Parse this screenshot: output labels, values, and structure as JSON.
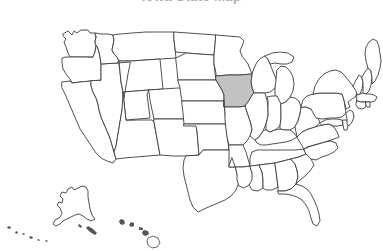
{
  "page": {
    "background_color": "#ffffff",
    "width": 383,
    "height": 251
  },
  "map": {
    "title": "Iowa State Map",
    "title_clipped": true,
    "type": "choropleth-outline",
    "region": "United States of America",
    "projection": "albers-usa",
    "outline_color": "#3c3c44",
    "default_fill": "#ffffff",
    "highlight_fill": "#c2c2c2",
    "highlighted_states": [
      "Iowa"
    ],
    "legend_visible": false,
    "labels_visible": false,
    "states": [
      {
        "code": "WA",
        "name": "Washington",
        "highlighted": false
      },
      {
        "code": "OR",
        "name": "Oregon",
        "highlighted": false
      },
      {
        "code": "CA",
        "name": "California",
        "highlighted": false
      },
      {
        "code": "NV",
        "name": "Nevada",
        "highlighted": false
      },
      {
        "code": "ID",
        "name": "Idaho",
        "highlighted": false
      },
      {
        "code": "MT",
        "name": "Montana",
        "highlighted": false
      },
      {
        "code": "WY",
        "name": "Wyoming",
        "highlighted": false
      },
      {
        "code": "UT",
        "name": "Utah",
        "highlighted": false
      },
      {
        "code": "AZ",
        "name": "Arizona",
        "highlighted": false
      },
      {
        "code": "CO",
        "name": "Colorado",
        "highlighted": false
      },
      {
        "code": "NM",
        "name": "New Mexico",
        "highlighted": false
      },
      {
        "code": "ND",
        "name": "North Dakota",
        "highlighted": false
      },
      {
        "code": "SD",
        "name": "South Dakota",
        "highlighted": false
      },
      {
        "code": "NE",
        "name": "Nebraska",
        "highlighted": false
      },
      {
        "code": "KS",
        "name": "Kansas",
        "highlighted": false
      },
      {
        "code": "OK",
        "name": "Oklahoma",
        "highlighted": false
      },
      {
        "code": "TX",
        "name": "Texas",
        "highlighted": false
      },
      {
        "code": "MN",
        "name": "Minnesota",
        "highlighted": false
      },
      {
        "code": "IA",
        "name": "Iowa",
        "highlighted": true
      },
      {
        "code": "MO",
        "name": "Missouri",
        "highlighted": false
      },
      {
        "code": "AR",
        "name": "Arkansas",
        "highlighted": false
      },
      {
        "code": "LA",
        "name": "Louisiana",
        "highlighted": false
      },
      {
        "code": "WI",
        "name": "Wisconsin",
        "highlighted": false
      },
      {
        "code": "IL",
        "name": "Illinois",
        "highlighted": false
      },
      {
        "code": "MI",
        "name": "Michigan",
        "highlighted": false
      },
      {
        "code": "IN",
        "name": "Indiana",
        "highlighted": false
      },
      {
        "code": "OH",
        "name": "Ohio",
        "highlighted": false
      },
      {
        "code": "KY",
        "name": "Kentucky",
        "highlighted": false
      },
      {
        "code": "TN",
        "name": "Tennessee",
        "highlighted": false
      },
      {
        "code": "MS",
        "name": "Mississippi",
        "highlighted": false
      },
      {
        "code": "AL",
        "name": "Alabama",
        "highlighted": false
      },
      {
        "code": "GA",
        "name": "Georgia",
        "highlighted": false
      },
      {
        "code": "FL",
        "name": "Florida",
        "highlighted": false
      },
      {
        "code": "SC",
        "name": "South Carolina",
        "highlighted": false
      },
      {
        "code": "NC",
        "name": "North Carolina",
        "highlighted": false
      },
      {
        "code": "VA",
        "name": "Virginia",
        "highlighted": false
      },
      {
        "code": "WV",
        "name": "West Virginia",
        "highlighted": false
      },
      {
        "code": "MD",
        "name": "Maryland",
        "highlighted": false
      },
      {
        "code": "DE",
        "name": "Delaware",
        "highlighted": false
      },
      {
        "code": "PA",
        "name": "Pennsylvania",
        "highlighted": false
      },
      {
        "code": "NJ",
        "name": "New Jersey",
        "highlighted": false
      },
      {
        "code": "NY",
        "name": "New York",
        "highlighted": false
      },
      {
        "code": "CT",
        "name": "Connecticut",
        "highlighted": false
      },
      {
        "code": "RI",
        "name": "Rhode Island",
        "highlighted": false
      },
      {
        "code": "MA",
        "name": "Massachusetts",
        "highlighted": false
      },
      {
        "code": "VT",
        "name": "Vermont",
        "highlighted": false
      },
      {
        "code": "NH",
        "name": "New Hampshire",
        "highlighted": false
      },
      {
        "code": "ME",
        "name": "Maine",
        "highlighted": false
      },
      {
        "code": "AK",
        "name": "Alaska",
        "highlighted": false
      },
      {
        "code": "HI",
        "name": "Hawaii",
        "highlighted": false
      }
    ]
  }
}
